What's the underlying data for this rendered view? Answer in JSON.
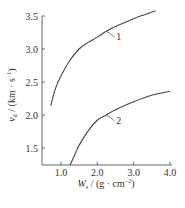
{
  "chart_data": {
    "type": "line",
    "title": "",
    "xlabel": "W_s / (g·cm⁻²)",
    "ylabel": "v_d / (km·s⁻¹)",
    "xlabel_parts": {
      "main": "W",
      "sub": "s",
      "rest": " / (g · cm",
      "sup": "−2",
      "end": ")"
    },
    "ylabel_parts": {
      "main": "v",
      "sub": "d",
      "rest": " / (km · s",
      "sup": "−1",
      "end": ")"
    },
    "xlim": [
      0.48,
      4.0
    ],
    "ylim": [
      1.24,
      3.62
    ],
    "x_ticks": [
      1.0,
      2.0,
      3.0,
      4.0
    ],
    "x_tick_labels": [
      "1.0",
      "2.0",
      "3.0",
      "4.0"
    ],
    "y_ticks": [
      1.5,
      2.0,
      2.5,
      3.0,
      3.5
    ],
    "y_tick_labels": [
      "1.5",
      "2.0",
      "2.5",
      "3.0",
      "3.5"
    ],
    "grid": false,
    "legend": "inline leader-line labels",
    "series": [
      {
        "name": "1",
        "x": [
          0.72,
          0.85,
          1.0,
          1.25,
          1.5,
          1.75,
          2.0,
          2.25,
          2.5,
          3.0,
          3.3,
          3.6
        ],
        "values": [
          2.14,
          2.4,
          2.59,
          2.83,
          3.0,
          3.1,
          3.18,
          3.27,
          3.34,
          3.46,
          3.52,
          3.58
        ],
        "label_anchor": {
          "x": 2.25,
          "y": 3.27
        }
      },
      {
        "name": "2",
        "x": [
          1.25,
          1.4,
          1.5,
          1.75,
          2.0,
          2.25,
          2.5,
          3.0,
          3.5,
          4.0
        ],
        "values": [
          1.24,
          1.42,
          1.54,
          1.76,
          1.92,
          2.0,
          2.08,
          2.2,
          2.3,
          2.36
        ],
        "label_anchor": {
          "x": 2.25,
          "y": 2.0
        }
      }
    ]
  }
}
